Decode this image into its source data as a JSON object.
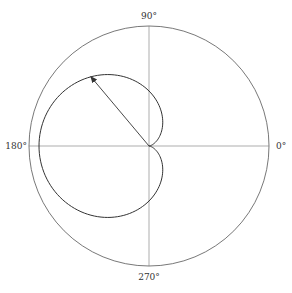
{
  "diagram": {
    "type": "polar-plot",
    "colors": {
      "background": "#ffffff",
      "circle": "#555555",
      "axes": "#777777",
      "curve": "#333333",
      "arrow": "#333333"
    },
    "center": {
      "x": 149,
      "y": 146
    },
    "outer_radius": 120,
    "cardioid": {
      "a": 55,
      "formula": "r = a(1 - cos θ)"
    },
    "arrow": {
      "angle_deg": 130
    },
    "labels": {
      "deg90": "90°",
      "deg180": "180°",
      "deg0": "0°",
      "deg270": "270°"
    }
  }
}
